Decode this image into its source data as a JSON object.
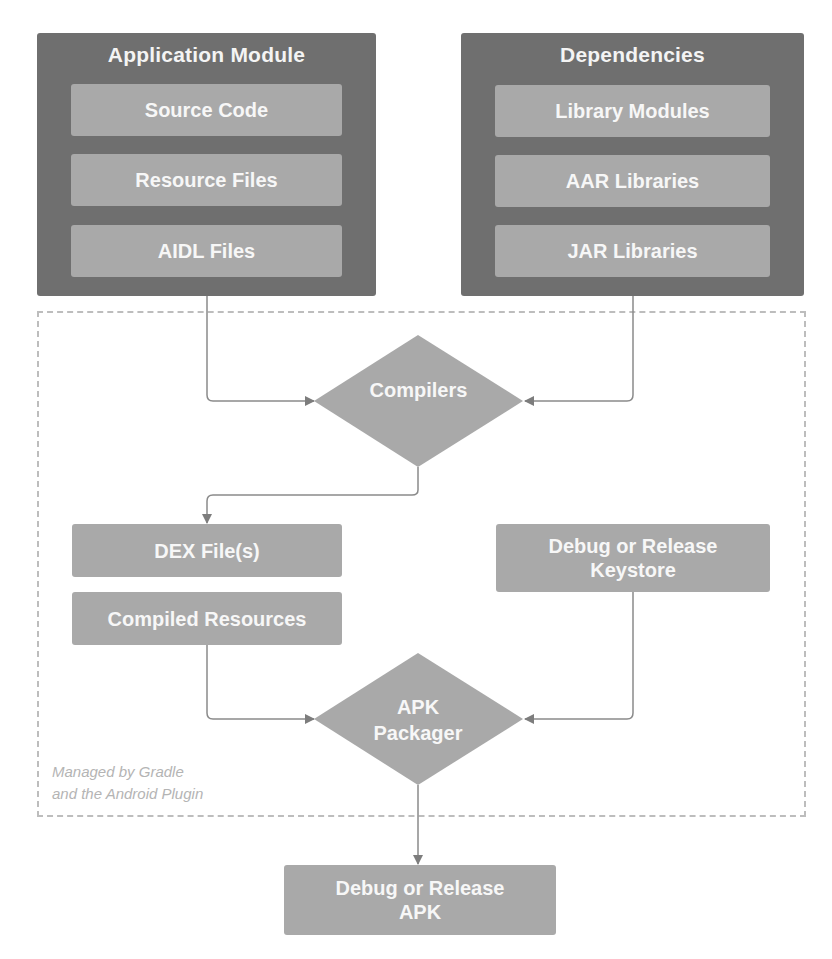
{
  "diagram": {
    "app_module": {
      "title": "Application Module",
      "items": [
        "Source Code",
        "Resource Files",
        "AIDL Files"
      ]
    },
    "dependencies": {
      "title": "Dependencies",
      "items": [
        "Library Modules",
        "AAR Libraries",
        "JAR Libraries"
      ]
    },
    "compilers": {
      "label": "Compilers"
    },
    "outputs": {
      "dex": "DEX File(s)",
      "compiled_resources": "Compiled Resources",
      "keystore": "Debug or Release Keystore"
    },
    "packager": {
      "label": "APK Packager"
    },
    "final": {
      "label": "Debug or Release APK"
    },
    "managed_note": {
      "line1": "Managed by Gradle",
      "line2": "and the Android Plugin"
    },
    "colors": {
      "module_dark": "#6f6f6f",
      "box_light": "#a9a9a9",
      "text": "#f7f7f7",
      "line": "#8a8a8a",
      "dashed_border": "#bdbdbd",
      "note_text": "#b4b4b4"
    }
  }
}
